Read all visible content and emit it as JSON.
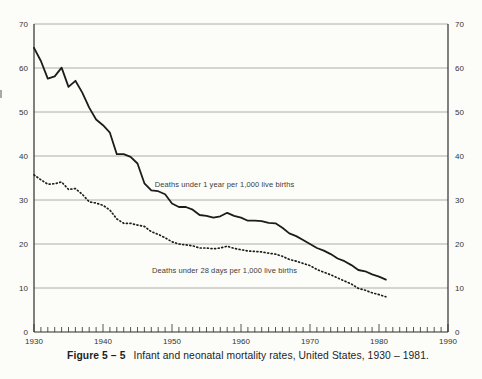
{
  "figure": {
    "caption_label": "Figure 5 – 5",
    "caption_text": "Infant and neonatal mortality rates, United States, 1930 – 1981."
  },
  "chart_data": {
    "type": "line",
    "x": [
      1930,
      1931,
      1932,
      1933,
      1934,
      1935,
      1936,
      1937,
      1938,
      1939,
      1940,
      1941,
      1942,
      1943,
      1944,
      1945,
      1946,
      1947,
      1948,
      1949,
      1950,
      1951,
      1952,
      1953,
      1954,
      1955,
      1956,
      1957,
      1958,
      1959,
      1960,
      1961,
      1962,
      1963,
      1964,
      1965,
      1966,
      1967,
      1968,
      1969,
      1970,
      1971,
      1972,
      1973,
      1974,
      1975,
      1976,
      1977,
      1978,
      1979,
      1980,
      1981
    ],
    "series": [
      {
        "name": "Deaths under 1 year per 1,000 live births",
        "style": "solid",
        "values": [
          64.6,
          61.6,
          57.6,
          58.1,
          60.1,
          55.7,
          57.1,
          54.4,
          51.0,
          48.3,
          47.0,
          45.3,
          40.4,
          40.4,
          39.8,
          38.3,
          33.8,
          32.2,
          32.0,
          31.3,
          29.2,
          28.4,
          28.4,
          27.8,
          26.6,
          26.4,
          26.0,
          26.3,
          27.1,
          26.4,
          26.0,
          25.3,
          25.3,
          25.2,
          24.8,
          24.7,
          23.7,
          22.4,
          21.8,
          20.9,
          20.0,
          19.1,
          18.5,
          17.7,
          16.7,
          16.1,
          15.2,
          14.1,
          13.8,
          13.1,
          12.6,
          11.9
        ]
      },
      {
        "name": "Deaths under 28 days per 1,000 live births",
        "style": "dotted",
        "values": [
          35.7,
          34.6,
          33.6,
          33.7,
          34.1,
          32.4,
          32.6,
          31.3,
          29.6,
          29.3,
          28.8,
          27.7,
          25.7,
          24.7,
          24.7,
          24.3,
          24.0,
          22.8,
          22.2,
          21.4,
          20.5,
          20.0,
          19.8,
          19.6,
          19.1,
          19.1,
          18.9,
          19.1,
          19.5,
          19.0,
          18.7,
          18.4,
          18.3,
          18.2,
          17.9,
          17.7,
          17.2,
          16.5,
          16.1,
          15.6,
          15.1,
          14.2,
          13.6,
          13.0,
          12.3,
          11.6,
          10.9,
          9.9,
          9.5,
          8.9,
          8.5,
          8.0
        ]
      }
    ],
    "xlim": [
      1930,
      1990
    ],
    "ylim": [
      0,
      70
    ],
    "y_ticks": [
      0,
      10,
      20,
      30,
      40,
      50,
      60,
      70
    ],
    "x_tick_labels": [
      1930,
      1940,
      1950,
      1960,
      1970,
      1980,
      1990
    ],
    "x_minor_tick_step": 1,
    "grid": "horizontal",
    "y_labels_both_sides": true,
    "annotations": [
      {
        "text": "Deaths under 1 year per 1,000 live births",
        "x": 1947.5,
        "y": 33.0
      },
      {
        "text": "Deaths under 28 days per 1,000 live births",
        "x": 1947.1,
        "y": 13.4
      }
    ],
    "colors": {
      "line": "#1c1c1c",
      "grid": "#9b9b9b",
      "frame": "#2c2c2c",
      "text": "#333333",
      "background": "#fcfcf9"
    }
  }
}
